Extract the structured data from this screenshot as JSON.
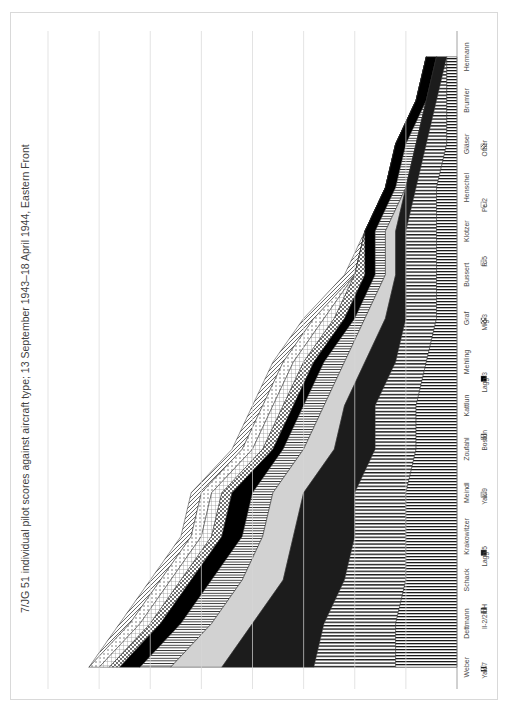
{
  "chart_data": {
    "type": "area",
    "title": "7/JG 51 individual pilot scores against aircraft type; 13 September 1943–18 April 1944, Eastern Front",
    "orientation": "rotated-90ccw-stacked-area",
    "xlabel": "",
    "ylabel": "",
    "ylim": [
      0,
      40
    ],
    "ticks": [
      "0",
      "5",
      "10",
      "15",
      "20",
      "25",
      "30",
      "35",
      "40"
    ],
    "grid": true,
    "legend_position": "bottom",
    "categories": [
      "Weber",
      "Dettmann",
      "Schack",
      "Krakowitzer",
      "Meindl",
      "Zoufahl",
      "Kattlun",
      "Mehling",
      "Graf",
      "Bussert",
      "Klotzer",
      "Henschel",
      "Gläser",
      "Brumler",
      "Hermann"
    ],
    "series": [
      {
        "name": "Yak-7",
        "pattern": "vlines",
        "values": [
          6,
          6,
          5,
          5,
          5,
          4,
          4,
          3,
          2,
          2,
          2,
          2,
          1,
          1,
          1
        ]
      },
      {
        "name": "Il-2/2mH",
        "pattern": "hlines",
        "values": [
          8,
          7,
          6,
          5,
          5,
          4,
          4,
          3,
          3,
          3,
          3,
          2,
          2,
          1,
          0
        ]
      },
      {
        "name": "Lagg-5",
        "pattern": "solid-dark",
        "values": [
          9,
          7,
          6,
          6,
          5,
          4,
          3,
          3,
          2,
          1,
          1,
          1,
          1,
          1,
          1
        ]
      },
      {
        "name": "Yak-9",
        "pattern": "light-grey",
        "values": [
          5,
          4,
          4,
          3,
          3,
          3,
          2,
          2,
          2,
          1,
          1,
          0,
          0,
          0,
          0
        ]
      },
      {
        "name": "Boston",
        "pattern": "thin-dark",
        "values": [
          3,
          3,
          3,
          2,
          2,
          2,
          2,
          2,
          1,
          1,
          1,
          1,
          1,
          0,
          0
        ]
      },
      {
        "name": "Lagg-3",
        "pattern": "solid-black",
        "values": [
          2,
          2,
          2,
          2,
          2,
          1,
          1,
          1,
          1,
          1,
          1,
          1,
          1,
          1,
          1
        ]
      },
      {
        "name": "Mig-3",
        "pattern": "cross",
        "values": [
          1,
          1,
          1,
          1,
          1,
          1,
          1,
          1,
          1,
          1,
          0,
          0,
          0,
          0,
          0
        ]
      },
      {
        "name": "R-5",
        "pattern": "grid-grey",
        "values": [
          1,
          1,
          1,
          1,
          1,
          1,
          1,
          1,
          1,
          0,
          0,
          0,
          0,
          0,
          0
        ]
      },
      {
        "name": "Pe-2",
        "pattern": "dots",
        "values": [
          1,
          1,
          1,
          1,
          1,
          1,
          1,
          1,
          1,
          0,
          0,
          0,
          0,
          0,
          0
        ]
      },
      {
        "name": "Other",
        "pattern": "diag",
        "values": [
          0,
          1,
          1,
          1,
          1,
          1,
          1,
          1,
          1,
          1,
          0,
          0,
          0,
          0,
          0
        ]
      }
    ],
    "totals": [
      36,
      33,
      30,
      27,
      26,
      22,
      20,
      18,
      14,
      11,
      9,
      7,
      6,
      4,
      3
    ]
  }
}
